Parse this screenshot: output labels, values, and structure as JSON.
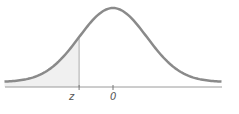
{
  "chart_data": {
    "type": "area",
    "title": "",
    "xlabel": "",
    "ylabel": "",
    "tick_labels": [
      "z",
      "0"
    ],
    "shaded_region": {
      "from": "-inf",
      "to": "z",
      "z_value": -1.0
    },
    "curve": {
      "mean": 0,
      "sd": 1
    },
    "xlim": [
      -3.2,
      3.2
    ],
    "grid": false,
    "legend": false
  },
  "labels": {
    "z": "z",
    "zero": "0"
  },
  "colors": {
    "curve": "#8a8a8a",
    "axis": "#9a9a9a",
    "shade": "#f0f0f0"
  }
}
